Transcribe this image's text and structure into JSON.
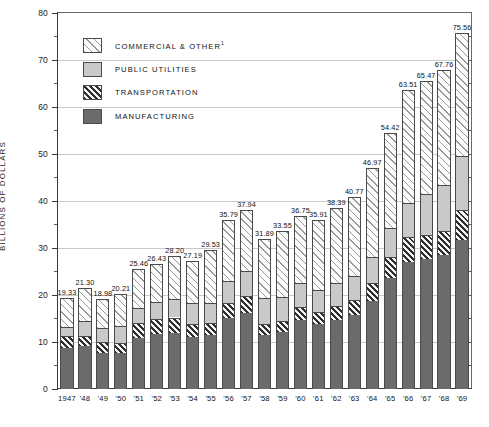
{
  "chart_data": {
    "type": "bar",
    "subtype": "stacked-vertical",
    "title": "",
    "xlabel": "",
    "ylabel": "BILLIONS OF DOLLARS",
    "ylim": [
      0,
      80
    ],
    "ytick_step_major": 10,
    "ytick_step_minor": 5,
    "grid": "horizontal-major",
    "legend_position": "inside-top-left",
    "categories": [
      "1947",
      "'48",
      "'49",
      "'50",
      "'51",
      "'52",
      "'53",
      "'54",
      "'55",
      "'56",
      "'57",
      "'58",
      "'59",
      "'60",
      "'61",
      "'62",
      "'63",
      "'64",
      "'65",
      "'66",
      "'67",
      "'68",
      "'69"
    ],
    "ytick_labels": [
      "0",
      "10",
      "20",
      "30",
      "40",
      "50",
      "60",
      "70",
      "80"
    ],
    "ytick_values": [
      0,
      10,
      20,
      30,
      40,
      50,
      60,
      70,
      80
    ],
    "totals": [
      19.33,
      21.3,
      18.98,
      20.21,
      25.46,
      26.43,
      28.2,
      27.19,
      29.53,
      35.79,
      37.94,
      31.89,
      33.55,
      36.75,
      35.91,
      38.39,
      40.77,
      46.97,
      54.42,
      63.51,
      65.47,
      67.76,
      75.56
    ],
    "series": [
      {
        "name": "MANUFACTURING",
        "key": "manufacturing",
        "pattern": "solid-dark",
        "color": "#6b6b6b",
        "values": [
          8.7,
          9.13,
          7.6,
          7.49,
          10.85,
          11.63,
          11.91,
          11.04,
          11.44,
          14.95,
          16.02,
          11.44,
          12.07,
          14.48,
          13.68,
          14.68,
          15.69,
          18.58,
          23.48,
          26.96,
          27.5,
          28.37,
          31.68
        ]
      },
      {
        "name": "TRANSPORTATION",
        "key": "transportation",
        "pattern": "hatch-dark",
        "color": "#2e2e2e",
        "values": [
          2.4,
          2.13,
          2.38,
          2.13,
          3.1,
          3.12,
          3.2,
          2.59,
          2.56,
          3.32,
          3.76,
          2.31,
          2.31,
          2.91,
          2.64,
          2.94,
          3.17,
          3.9,
          4.5,
          5.31,
          5.15,
          5.06,
          6.32
        ]
      },
      {
        "name": "PUBLIC UTILITIES",
        "key": "public_utilities",
        "pattern": "solid-light",
        "color": "#c9c9c9",
        "values": [
          2.0,
          3.14,
          3.0,
          3.58,
          3.21,
          3.58,
          3.89,
          4.56,
          4.23,
          4.52,
          5.16,
          5.54,
          5.17,
          4.96,
          4.6,
          4.77,
          5.01,
          5.49,
          6.22,
          7.24,
          8.82,
          9.83,
          11.5
        ]
      },
      {
        "name": "COMMERCIAL & OTHER",
        "key": "commercial_other",
        "pattern": "hatch-light",
        "color": "#9a9a9a",
        "footnote_marker": "1",
        "values": [
          6.23,
          6.9,
          6.0,
          7.01,
          8.3,
          8.1,
          9.2,
          9.0,
          11.3,
          12.99,
          13.0,
          12.6,
          14.0,
          14.4,
          14.99,
          16.0,
          16.9,
          19.0,
          20.22,
          24.0,
          24.0,
          24.5,
          26.06
        ]
      }
    ],
    "value_labels": [
      "19.33",
      "21.30",
      "18.98",
      "20.21",
      "25.46",
      "26.43",
      "28.20",
      "27.19",
      "29.53",
      "35.79",
      "37.94",
      "31.89",
      "33.55",
      "36.75",
      "35.91",
      "38.39",
      "40.77",
      "46.97",
      "54.42",
      "63.51",
      "65.47",
      "67.76",
      "75.56"
    ]
  },
  "legend": {
    "items": [
      {
        "label": "COMMERCIAL & OTHER",
        "sup": "1",
        "swatch": "hatch-light-swatch"
      },
      {
        "label": "PUBLIC UTILITIES",
        "sup": "",
        "swatch": "solid-light-swatch"
      },
      {
        "label": "TRANSPORTATION",
        "sup": "",
        "swatch": "hatch-dark-swatch"
      },
      {
        "label": "MANUFACTURING",
        "sup": "",
        "swatch": "solid-dark-swatch"
      }
    ]
  }
}
